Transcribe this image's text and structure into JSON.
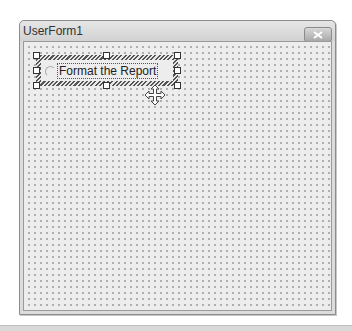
{
  "window": {
    "title": "UserForm1",
    "close_icon": "close-x-icon"
  },
  "control": {
    "type": "option-button",
    "caption": "Format the Report",
    "selected": true
  },
  "cursor": {
    "icon": "move-cursor-icon"
  }
}
